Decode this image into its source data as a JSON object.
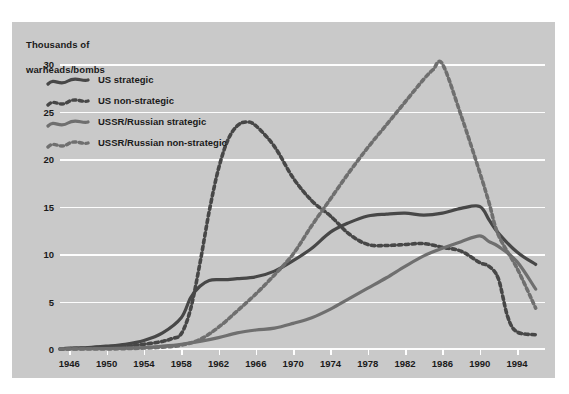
{
  "chart_data": {
    "type": "line",
    "title": "",
    "axis_title": "Thousands of\nwarheads/bombs",
    "xlabel": "",
    "ylabel": "Thousands of warheads/bombs",
    "xlim": [
      1945,
      1997
    ],
    "ylim": [
      0,
      30
    ],
    "yticks": [
      0,
      5,
      10,
      15,
      20,
      25,
      30
    ],
    "xticks": [
      1946,
      1950,
      1954,
      1958,
      1962,
      1966,
      1970,
      1974,
      1978,
      1982,
      1986,
      1990,
      1994
    ],
    "grid": "horizontal",
    "legend_position": "upper-left-inside",
    "colors": {
      "us": "#474747",
      "ussr": "#6f6f6f",
      "panel_background": "#c9c9c9",
      "gridline": "#fdfdfd",
      "text": "#1a1a1a",
      "page_background": "#ffffff"
    },
    "series": [
      {
        "name": "US strategic",
        "style": "solid",
        "color": "#474747",
        "x": [
          1945,
          1946,
          1948,
          1950,
          1952,
          1954,
          1956,
          1958,
          1959,
          1960,
          1961,
          1962,
          1963,
          1964,
          1966,
          1968,
          1970,
          1972,
          1974,
          1976,
          1978,
          1980,
          1982,
          1984,
          1986,
          1988,
          1990,
          1991,
          1992,
          1994,
          1996
        ],
        "values": [
          0.0,
          0.1,
          0.15,
          0.3,
          0.5,
          0.9,
          1.7,
          3.3,
          5.4,
          6.6,
          7.2,
          7.3,
          7.3,
          7.4,
          7.6,
          8.2,
          9.3,
          10.6,
          12.3,
          13.3,
          14.0,
          14.2,
          14.3,
          14.1,
          14.3,
          14.8,
          15.0,
          13.6,
          12.2,
          10.2,
          8.9
        ]
      },
      {
        "name": "US non-strategic",
        "style": "dotted",
        "color": "#474747",
        "x": [
          1945,
          1948,
          1950,
          1952,
          1954,
          1956,
          1957,
          1958,
          1959,
          1960,
          1961,
          1962,
          1963,
          1964,
          1965,
          1966,
          1968,
          1970,
          1972,
          1974,
          1976,
          1978,
          1980,
          1982,
          1984,
          1986,
          1988,
          1990,
          1991,
          1992,
          1993,
          1994,
          1996
        ],
        "values": [
          0.0,
          0.1,
          0.2,
          0.3,
          0.5,
          0.8,
          1.1,
          1.6,
          4.2,
          9.0,
          14.5,
          19.0,
          22.0,
          23.5,
          23.9,
          23.5,
          21.3,
          18.0,
          15.6,
          14.0,
          12.1,
          11.0,
          10.9,
          11.0,
          11.1,
          10.7,
          10.3,
          9.1,
          8.7,
          7.4,
          3.4,
          1.8,
          1.5
        ]
      },
      {
        "name": "USSR/Russian strategic",
        "style": "solid",
        "color": "#6f6f6f",
        "x": [
          1945,
          1950,
          1954,
          1956,
          1958,
          1960,
          1962,
          1964,
          1966,
          1968,
          1970,
          1972,
          1974,
          1976,
          1978,
          1980,
          1982,
          1984,
          1986,
          1988,
          1990,
          1991,
          1992,
          1994,
          1996
        ],
        "values": [
          0.0,
          0.05,
          0.15,
          0.3,
          0.5,
          0.8,
          1.2,
          1.7,
          2.0,
          2.2,
          2.7,
          3.3,
          4.2,
          5.3,
          6.4,
          7.5,
          8.7,
          9.8,
          10.6,
          11.3,
          11.9,
          11.3,
          10.8,
          9.2,
          6.3
        ]
      },
      {
        "name": "USSR/Russian non-strategic",
        "style": "dotted",
        "color": "#6f6f6f",
        "x": [
          1945,
          1950,
          1954,
          1956,
          1958,
          1960,
          1962,
          1964,
          1966,
          1968,
          1970,
          1972,
          1974,
          1976,
          1978,
          1980,
          1982,
          1984,
          1985,
          1986,
          1988,
          1990,
          1991,
          1992,
          1994,
          1996
        ],
        "values": [
          0.0,
          0.0,
          0.1,
          0.2,
          0.4,
          1.0,
          2.3,
          4.0,
          5.8,
          7.8,
          10.0,
          13.0,
          15.8,
          18.6,
          21.2,
          23.6,
          26.0,
          28.4,
          29.4,
          30.0,
          24.6,
          18.6,
          15.4,
          12.0,
          8.5,
          4.3
        ]
      }
    ]
  },
  "legend": {
    "items": [
      {
        "label": "US strategic",
        "style": "solid",
        "color": "#474747"
      },
      {
        "label": "US non-strategic",
        "style": "dotted",
        "color": "#474747"
      },
      {
        "label": "USSR/Russian strategic",
        "style": "solid",
        "color": "#6f6f6f"
      },
      {
        "label": "USSR/Russian non-strategic",
        "style": "dotted",
        "color": "#6f6f6f"
      }
    ]
  },
  "axis": {
    "y_title_line1": "Thousands of",
    "y_title_line2": "warheads/bombs",
    "y_tick_labels": [
      "0",
      "5",
      "10",
      "15",
      "20",
      "25",
      "30"
    ],
    "x_tick_labels": [
      "1946",
      "1950",
      "1954",
      "1958",
      "1962",
      "1966",
      "1970",
      "1974",
      "1978",
      "1982",
      "1986",
      "1990",
      "1994"
    ]
  }
}
